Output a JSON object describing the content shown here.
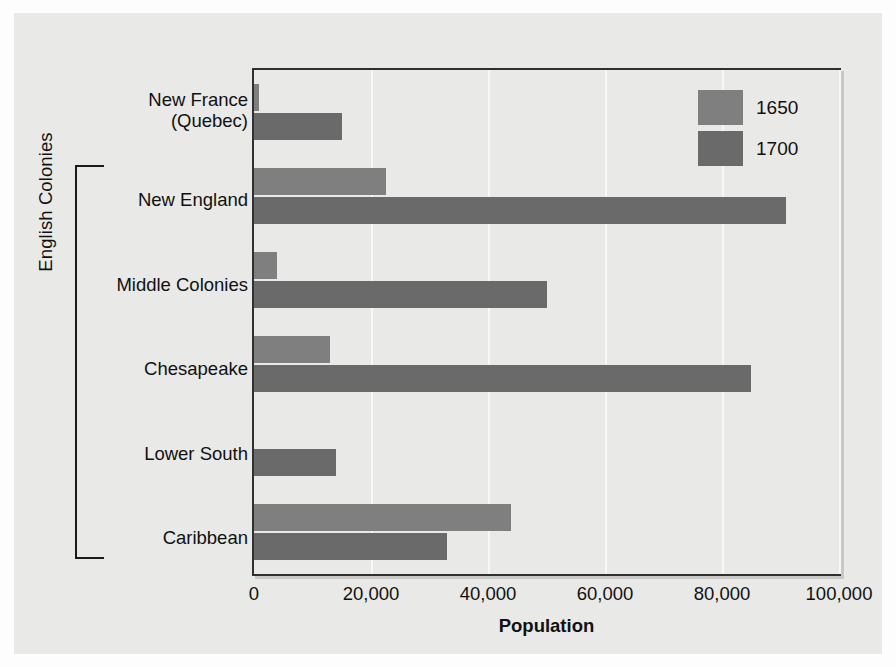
{
  "figure": {
    "group_bracket_label": "English Colonies",
    "background_color": "#e9e9e7",
    "page_color": "#fdfdfd"
  },
  "legend": {
    "position": "top-right",
    "entries": [
      {
        "label": "1650",
        "color": "#7f7f7f"
      },
      {
        "label": "1700",
        "color": "#6a6a6a"
      }
    ]
  },
  "axis": {
    "x_title": "Population",
    "x_ticks": [
      "0",
      "20,000",
      "40,000",
      "60,000",
      "80,000",
      "100,000"
    ],
    "x_tick_values": [
      0,
      20000,
      40000,
      60000,
      80000,
      100000
    ]
  },
  "categories": [
    {
      "label_line1": "New France",
      "label_line2": "(Quebec)"
    },
    {
      "label_line1": "New England",
      "label_line2": ""
    },
    {
      "label_line1": "Middle Colonies",
      "label_line2": ""
    },
    {
      "label_line1": "Chesapeake",
      "label_line2": ""
    },
    {
      "label_line1": "Lower South",
      "label_line2": ""
    },
    {
      "label_line1": "Caribbean",
      "label_line2": ""
    }
  ],
  "chart_data": {
    "type": "bar",
    "orientation": "horizontal",
    "title": "",
    "xlabel": "Population",
    "ylabel": "",
    "xlim": [
      0,
      100000
    ],
    "grid": true,
    "legend_position": "top-right",
    "categories": [
      "New France (Quebec)",
      "New England",
      "Middle Colonies",
      "Chesapeake",
      "Lower South",
      "Caribbean"
    ],
    "series": [
      {
        "name": "1650",
        "color": "#7f7f7f",
        "values": [
          900,
          22500,
          4000,
          13000,
          0,
          44000
        ]
      },
      {
        "name": "1700",
        "color": "#6a6a6a",
        "values": [
          15000,
          91000,
          50000,
          85000,
          14000,
          33000
        ]
      }
    ],
    "group_annotation": {
      "label": "English Colonies",
      "covers": [
        "New England",
        "Middle Colonies",
        "Chesapeake",
        "Lower South",
        "Caribbean"
      ]
    }
  }
}
